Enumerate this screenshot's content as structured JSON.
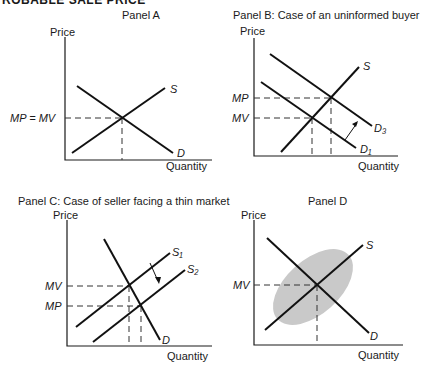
{
  "header": {
    "title": "ROBABLE SALE PRICE"
  },
  "panels": [
    {
      "id": "A",
      "title": "Panel A",
      "y_axis_label": "Price",
      "x_axis_label": "Quantity",
      "price_label": "MP = MV",
      "curves": {
        "supply": "S",
        "demand": "D"
      }
    },
    {
      "id": "B",
      "title": "Panel B: Case of an uninformed buyer",
      "y_axis_label": "Price",
      "x_axis_label": "Quantity",
      "price_labels": {
        "upper": "MP",
        "lower": "MV"
      },
      "curves": {
        "supply": "S",
        "demand_shifted": "D₃",
        "demand_original": "D₁"
      }
    },
    {
      "id": "C",
      "title": "Panel C: Case of seller facing a thin market",
      "y_axis_label": "Price",
      "x_axis_label": "Quantity",
      "price_labels": {
        "upper": "MV",
        "lower": "MP"
      },
      "curves": {
        "supply_original": "S₁",
        "supply_shifted": "S₂",
        "demand": "D"
      }
    },
    {
      "id": "D",
      "title": "Panel D",
      "y_axis_label": "Price",
      "x_axis_label": "Quantity",
      "price_label": "MV",
      "curves": {
        "supply": "S",
        "demand": "D"
      }
    }
  ],
  "colors": {
    "line": "#111111",
    "ellipse_fill": "#c9c9c9",
    "background": "#ffffff"
  }
}
